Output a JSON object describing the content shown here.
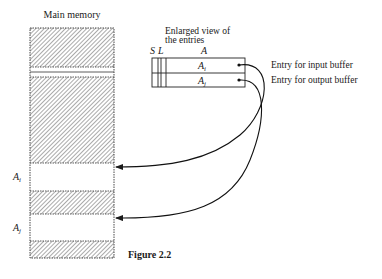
{
  "memory": {
    "title": "Main memory",
    "regions": [
      {
        "type": "used"
      },
      {
        "type": "free",
        "label": ""
      },
      {
        "type": "used"
      },
      {
        "type": "buffer",
        "label": "A",
        "sub": "i"
      },
      {
        "type": "used"
      },
      {
        "type": "buffer",
        "label": "A",
        "sub": "j"
      },
      {
        "type": "used"
      }
    ]
  },
  "entries": {
    "caption_line1": "Enlarged view of",
    "caption_line2": "the entries",
    "col_s": "S",
    "col_l": "L",
    "col_a": "A",
    "rows": [
      {
        "label": "A",
        "sub": "i",
        "description": "Entry for input buffer"
      },
      {
        "label": "A",
        "sub": "j",
        "description": "Entry for output buffer"
      }
    ]
  },
  "figure_caption": "Figure 2.2"
}
